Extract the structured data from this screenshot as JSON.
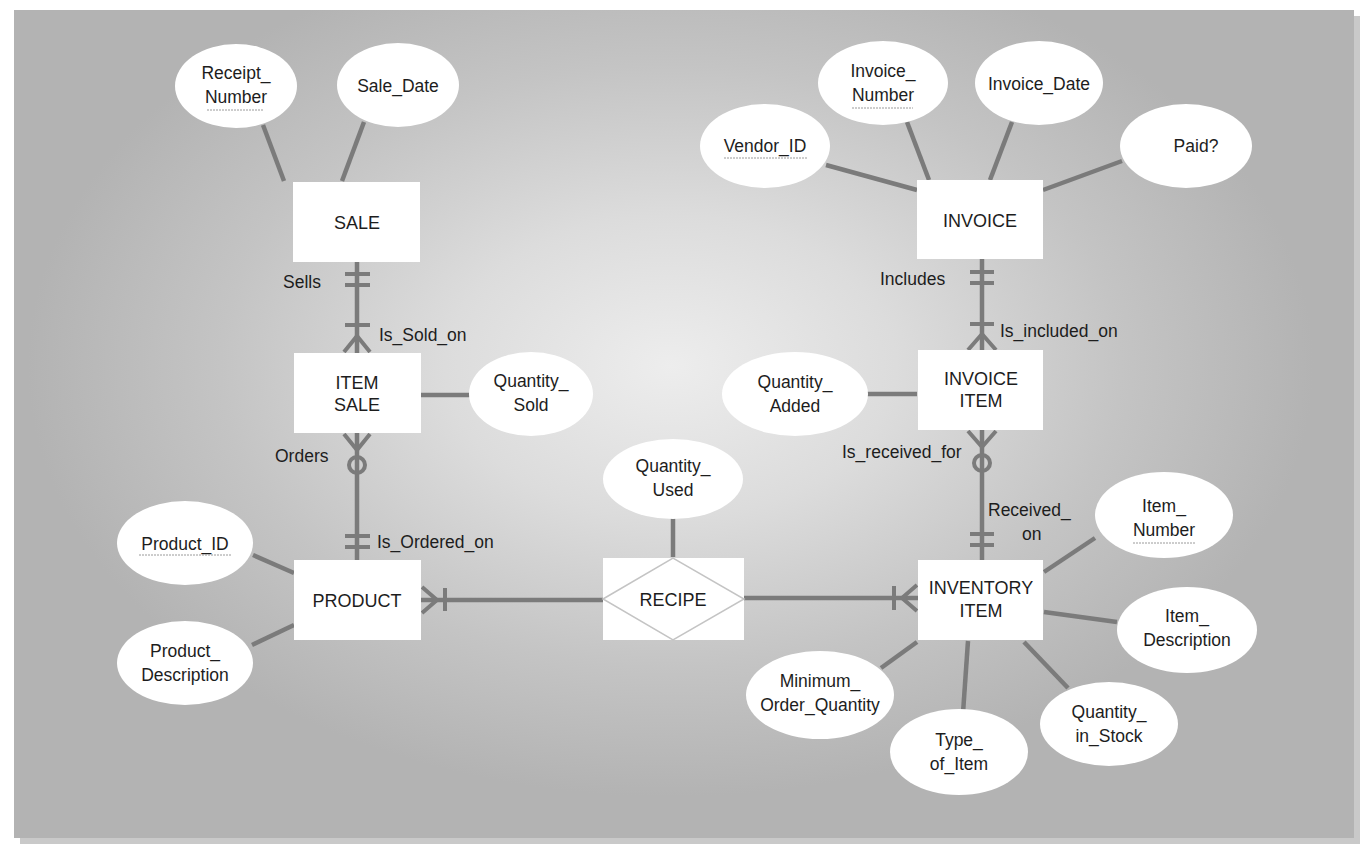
{
  "diagram": {
    "type": "entity-relationship",
    "colors": {
      "background_center": "#ededed",
      "background_edge": "#b3b3b3",
      "connector": "#7b7b7b",
      "entity_fill": "#ffffff",
      "text": "#1d1d1d"
    },
    "entities": {
      "sale": {
        "label": "SALE"
      },
      "item_sale": {
        "line1": "ITEM",
        "line2": "SALE"
      },
      "product": {
        "label": "PRODUCT"
      },
      "invoice": {
        "label": "INVOICE"
      },
      "invoice_item": {
        "line1": "INVOICE",
        "line2": "ITEM"
      },
      "inventory_item": {
        "line1": "INVENTORY",
        "line2": "ITEM"
      }
    },
    "associative_entities": {
      "recipe": {
        "label": "RECIPE"
      }
    },
    "attributes": {
      "receipt_number": {
        "line1": "Receipt_",
        "line2": "Number",
        "key": true
      },
      "sale_date": {
        "label": "Sale_Date"
      },
      "quantity_sold": {
        "line1": "Quantity_",
        "line2": "Sold"
      },
      "product_id": {
        "label": "Product_ID",
        "key": true
      },
      "product_description": {
        "line1": "Product_",
        "line2": "Description"
      },
      "quantity_used": {
        "line1": "Quantity_",
        "line2": "Used"
      },
      "vendor_id": {
        "label": "Vendor_ID",
        "key": true
      },
      "invoice_number": {
        "line1": "Invoice_",
        "line2": "Number",
        "key": true
      },
      "invoice_date": {
        "label": "Invoice_Date"
      },
      "paid": {
        "label": "Paid?"
      },
      "quantity_added": {
        "line1": "Quantity_",
        "line2": "Added"
      },
      "item_number": {
        "line1": "Item_",
        "line2": "Number",
        "key": true
      },
      "item_description": {
        "line1": "Item_",
        "line2": "Description"
      },
      "quantity_in_stock": {
        "line1": "Quantity_",
        "line2": "in_Stock"
      },
      "type_of_item": {
        "line1": "Type_",
        "line2": "of_Item"
      },
      "minimum_order_quantity": {
        "line1": "Minimum_",
        "line2": "Order_Quantity"
      }
    },
    "relationships": {
      "sells": "Sells",
      "is_sold_on": "Is_Sold_on",
      "orders": "Orders",
      "is_ordered_on": "Is_Ordered_on",
      "includes": "Includes",
      "is_included_on": "Is_included_on",
      "is_received_for": "Is_received_for",
      "received_on_line1": "Received_",
      "received_on_line2": "on"
    },
    "cardinalities": [
      {
        "from": "SALE",
        "to": "ITEM SALE",
        "near_from": "one-and-only-one",
        "near_to": "one-or-many"
      },
      {
        "from": "ITEM SALE",
        "to": "PRODUCT",
        "near_from": "zero-or-many",
        "near_to": "one-and-only-one"
      },
      {
        "from": "PRODUCT",
        "to": "RECIPE",
        "near_from": "one-or-many"
      },
      {
        "from": "RECIPE",
        "to": "INVENTORY ITEM",
        "near_to": "one-or-many"
      },
      {
        "from": "INVOICE",
        "to": "INVOICE ITEM",
        "near_from": "one-and-only-one",
        "near_to": "one-or-many"
      },
      {
        "from": "INVOICE ITEM",
        "to": "INVENTORY ITEM",
        "near_from": "zero-or-many",
        "near_to": "one-and-only-one"
      }
    ]
  }
}
